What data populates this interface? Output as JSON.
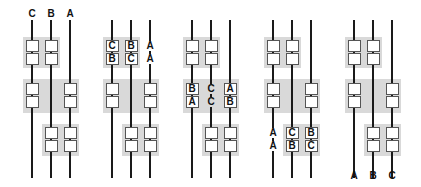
{
  "diagram": {
    "panels": [
      {
        "id": 1,
        "top_labels": [
          "C",
          "B",
          "A"
        ],
        "bottom_labels": [
          "",
          "",
          ""
        ],
        "top_group": [
          [
            "",
            ""
          ],
          [
            "",
            ""
          ]
        ],
        "middle_group": {
          "left": [
            "",
            ""
          ],
          "center": [
            "",
            ""
          ],
          "right": [
            "",
            ""
          ]
        },
        "bottom_group": [
          [
            "",
            ""
          ],
          [
            "",
            ""
          ]
        ]
      },
      {
        "id": 2,
        "top_labels": [
          "",
          "",
          ""
        ],
        "bottom_labels": [
          "",
          "",
          ""
        ],
        "top_group": [
          [
            "C",
            "B"
          ],
          [
            "B",
            "C"
          ]
        ],
        "top_side_labels": [
          "A",
          "A"
        ],
        "middle_group": {
          "left": [
            "",
            ""
          ],
          "center": [
            "",
            ""
          ],
          "right": [
            "",
            ""
          ]
        },
        "bottom_group": [
          [
            "",
            ""
          ],
          [
            "",
            ""
          ]
        ]
      },
      {
        "id": 3,
        "top_labels": [
          "",
          "",
          ""
        ],
        "bottom_labels": [
          "",
          "",
          ""
        ],
        "top_group": [
          [
            "",
            ""
          ],
          [
            "",
            ""
          ]
        ],
        "middle_group": {
          "left": [
            "B",
            "A"
          ],
          "center": [
            "C",
            "C"
          ],
          "right": [
            "A",
            "B"
          ]
        },
        "bottom_group": [
          [
            "",
            ""
          ],
          [
            "",
            ""
          ]
        ]
      },
      {
        "id": 4,
        "top_labels": [
          "",
          "",
          ""
        ],
        "bottom_labels": [
          "",
          "",
          ""
        ],
        "top_group": [
          [
            "",
            ""
          ],
          [
            "",
            ""
          ]
        ],
        "middle_group": {
          "left": [
            "",
            ""
          ],
          "center": [
            "",
            ""
          ],
          "right": [
            "",
            ""
          ]
        },
        "bottom_side_labels": [
          "A",
          "A"
        ],
        "bottom_group": [
          [
            "C",
            "B"
          ],
          [
            "B",
            "C"
          ]
        ]
      },
      {
        "id": 5,
        "top_labels": [
          "",
          "",
          ""
        ],
        "bottom_labels": [
          "A",
          "B",
          "C"
        ],
        "top_group": [
          [
            "",
            ""
          ],
          [
            "",
            ""
          ]
        ],
        "middle_group": {
          "left": [
            "",
            ""
          ],
          "center": [
            "",
            ""
          ],
          "right": [
            "",
            ""
          ]
        },
        "bottom_group": [
          [
            "",
            ""
          ],
          [
            "",
            ""
          ]
        ]
      }
    ],
    "colors": {
      "line": "#1a1a1a",
      "band": "#d9d9d9",
      "box_border": "#555555",
      "box_fill": "#ffffff"
    }
  }
}
